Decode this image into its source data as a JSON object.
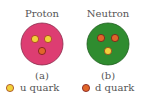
{
  "proton": {
    "title": "Proton",
    "caption": "(a)",
    "color": "#dd3d72",
    "quarks": [
      "u",
      "u",
      "d"
    ]
  },
  "neutron": {
    "title": "Neutron",
    "caption": "(b)",
    "color": "#2f8c2f",
    "quarks": [
      "d",
      "d",
      "u"
    ]
  },
  "legend": {
    "u_label": "u quark",
    "d_label": "d quark",
    "u_color": "#f2d13a",
    "d_color": "#e0662a"
  }
}
